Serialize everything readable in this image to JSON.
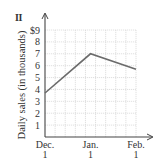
{
  "panel_label": "II",
  "chart_data": {
    "type": "line",
    "title": "",
    "xlabel": "",
    "ylabel": "Daily sales (in thousands)",
    "categories": [
      "Dec. 1",
      "Jan. 1",
      "Feb. 1"
    ],
    "x_tick_lines": [
      [
        "Dec.",
        "1"
      ],
      [
        "Jan.",
        "1"
      ],
      [
        "Feb.",
        "1"
      ]
    ],
    "series": [
      {
        "name": "Daily sales",
        "values": [
          3.7,
          7.0,
          5.7
        ]
      }
    ],
    "y_ticks": [
      "1",
      "2",
      "3",
      "4",
      "5",
      "6",
      "7",
      "8",
      "$9"
    ],
    "ylim": [
      0,
      9
    ],
    "grid": true,
    "legend": null,
    "colors": {
      "line": "#6b6b6b",
      "grid": "#d8d8d8",
      "axis": "#444444"
    }
  }
}
